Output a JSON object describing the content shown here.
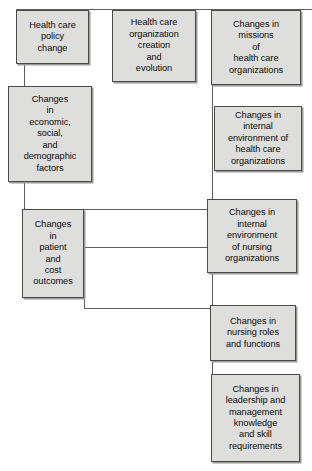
{
  "figure": {
    "type": "flowchart",
    "background_color": "#ffffff",
    "node_fill_color": "#dededc",
    "node_border_color": "#4a4a4a",
    "connector_color": "#5d5d5d",
    "text_color": "#0b0b0b",
    "caption": ""
  },
  "nodes": [
    {
      "id": "policy-change",
      "label": "Health care\npolicy\nchange",
      "x": 16,
      "y": 10,
      "w": 73,
      "h": 54
    },
    {
      "id": "organization-creation",
      "label": "Health care\norganization\ncreation\nand\nevolution",
      "x": 112,
      "y": 10,
      "w": 84,
      "h": 72
    },
    {
      "id": "missions-change",
      "label": "Changes in\nmissions\nof\nhealth care\norganizations",
      "x": 211,
      "y": 10,
      "w": 90,
      "h": 75
    },
    {
      "id": "economic-social-demographic",
      "label": "Changes\nin\neconomic,\nsocial,\nand\ndemographic\nfactors",
      "x": 8,
      "y": 86,
      "w": 84,
      "h": 96
    },
    {
      "id": "internal-env-health-care",
      "label": "Changes in\ninternal\nenvironment of\nhealth care\norganizations",
      "x": 214,
      "y": 106,
      "w": 88,
      "h": 65
    },
    {
      "id": "patient-cost-outcomes",
      "label": "Changes\nin\npatient\nand\ncost\noutcomes",
      "x": 22,
      "y": 209,
      "w": 62,
      "h": 89
    },
    {
      "id": "internal-env-nursing",
      "label": "Changes in\ninternal\nenvironment\nof nursing\norganizations",
      "x": 207,
      "y": 199,
      "w": 90,
      "h": 74
    },
    {
      "id": "nursing-roles-functions",
      "label": "Changes in\nnursing roles\nand functions",
      "x": 210,
      "y": 305,
      "w": 86,
      "h": 56
    },
    {
      "id": "leadership-management",
      "label": "Changes in\nleadership and\nmanagement\nknowledge\nand skill\nrequirements",
      "x": 211,
      "y": 374,
      "w": 89,
      "h": 88
    }
  ],
  "connectors": [
    {
      "id": "top-rail",
      "orientation": "h",
      "x": 16,
      "y": 9,
      "length": 296
    },
    {
      "id": "policy-to-economic",
      "orientation": "v",
      "x": 24,
      "y": 64,
      "length": 23
    },
    {
      "id": "economic-down-stub",
      "orientation": "v",
      "x": 24,
      "y": 182,
      "length": 28
    },
    {
      "id": "economic-to-outcomes-rail",
      "orientation": "h",
      "x": 24,
      "y": 209,
      "length": 184
    },
    {
      "id": "outcomes-to-nursing-env",
      "orientation": "h",
      "x": 84,
      "y": 247,
      "length": 124
    },
    {
      "id": "outcomes-bottom-stub",
      "orientation": "v",
      "x": 84,
      "y": 297,
      "length": 12
    },
    {
      "id": "outcomes-bottom-rail",
      "orientation": "h",
      "x": 84,
      "y": 308,
      "length": 128
    },
    {
      "id": "right-column-spine",
      "orientation": "v",
      "x": 212,
      "y": 85,
      "length": 229
    },
    {
      "id": "missions-spine-stub",
      "orientation": "v",
      "x": 212,
      "y": 85,
      "length": 21
    },
    {
      "id": "health-env-to-nursing-env",
      "orientation": "v",
      "x": 212,
      "y": 171,
      "length": 28
    },
    {
      "id": "nursing-env-to-roles",
      "orientation": "v",
      "x": 212,
      "y": 273,
      "length": 32
    },
    {
      "id": "roles-to-leadership",
      "orientation": "v",
      "x": 212,
      "y": 361,
      "length": 13
    }
  ]
}
